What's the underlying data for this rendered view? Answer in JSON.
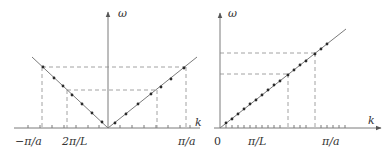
{
  "colors": {
    "axis": "#7a7a7a",
    "curve": "#7a7a7a",
    "dash": "#8a8a8a",
    "point": "#2a2a2a",
    "text": "#333333"
  },
  "left_panel": {
    "y_axis_label": "ω",
    "x_axis_label": "k",
    "x_tick_labels": [
      "−π/a",
      "2π/L",
      "π/a"
    ],
    "description": "V-shaped dispersion ω = c|k| with discrete points, dashed guides at ±π/a and ±2π/L"
  },
  "right_panel": {
    "y_axis_label": "ω",
    "x_axis_label": "k",
    "x_tick_labels": [
      "0",
      "π/L",
      "π/a"
    ],
    "description": "Linear dispersion ω = ck from origin with discrete points, dashed guides at π/L and π/a"
  }
}
